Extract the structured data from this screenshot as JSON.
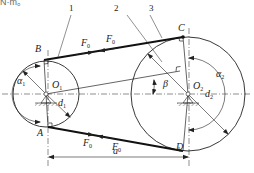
{
  "figure": {
    "clipped_text": "N·m。",
    "part_labels": [
      "1",
      "2",
      "3"
    ],
    "points": {
      "B": "B",
      "C": "C",
      "A": "A",
      "D": "D"
    },
    "centers": {
      "o1": "O",
      "o1_sub": "1",
      "o2": "O",
      "o2_sub": "2"
    },
    "forces": {
      "f": "F",
      "f_sub": "0"
    },
    "angles": {
      "alpha": "α",
      "alpha1_sub": "1",
      "alpha2_sub": "2",
      "beta": "β"
    },
    "diameters": {
      "d": "d",
      "d1_sub": "1",
      "d2_sub": "2"
    },
    "dimension": {
      "a": "a"
    },
    "colors": {
      "line": "#222222",
      "belt": "#111111",
      "centerline": "#444444"
    }
  }
}
